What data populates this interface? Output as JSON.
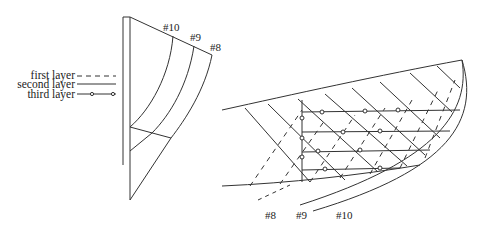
{
  "legend": {
    "items": [
      {
        "label": "first layer",
        "style": "dashed"
      },
      {
        "label": "second layer",
        "style": "solid"
      },
      {
        "label": "third layer",
        "style": "solid-with-circles"
      }
    ]
  },
  "left_figure": {
    "labels": [
      "#10",
      "#9",
      "#8"
    ]
  },
  "right_figure": {
    "labels": [
      "#8",
      "#9",
      "#10"
    ]
  },
  "colors": {
    "stroke": "#333333",
    "background": "#ffffff",
    "text": "#222222"
  }
}
